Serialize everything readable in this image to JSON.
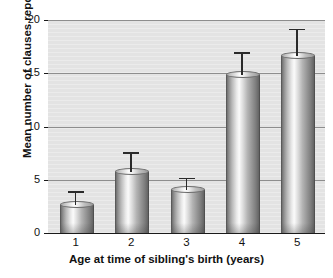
{
  "chart_data": {
    "type": "bar",
    "title": "",
    "xlabel": "Age at time of sibling's birth (years)",
    "ylabel": "Mean number of clauses reported",
    "categories": [
      "1",
      "2",
      "3",
      "4",
      "5"
    ],
    "values": [
      2.6,
      5.7,
      4.0,
      14.8,
      16.6
    ],
    "error_high": [
      3.9,
      7.6,
      5.2,
      17.0,
      19.2
    ],
    "error_bars": [
      1.3,
      1.9,
      1.2,
      2.2,
      2.6
    ],
    "ylim": [
      0,
      20
    ],
    "yticks": [
      0,
      5,
      10,
      15,
      20
    ],
    "ytick_labels": [
      "0",
      "5",
      "10",
      "15",
      "20"
    ],
    "grid": true,
    "gridlines_at": [
      5,
      10,
      15,
      20
    ],
    "legend": null,
    "legend_position": "none",
    "series": [
      {
        "name": "Mean number of clauses reported",
        "values": [
          2.6,
          5.7,
          4.0,
          14.8,
          16.6
        ]
      }
    ],
    "colors": {
      "plot_background": "#e3e3e3",
      "page_background": "#ffffff",
      "gridline": "#8d8d8d",
      "axis": "#1a1a1a",
      "bar_light": "#fbfbfb",
      "bar_mid": "#b4b4b4",
      "bar_dark": "#636363",
      "error_bar": "#2a2a2a",
      "text": "#111111"
    }
  }
}
